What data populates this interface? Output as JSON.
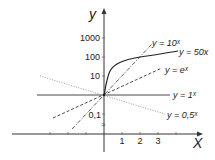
{
  "diagram": {
    "axes": {
      "x_label": "X",
      "y_label": "y",
      "x_ticks": [
        "1",
        "2",
        "3"
      ],
      "y_ticks": [
        "1000",
        "100",
        "10",
        "0,1"
      ]
    },
    "curves": [
      {
        "name": "y = 10ˣ",
        "style": "dash-dot",
        "color": "#333333"
      },
      {
        "name": "y = 50x",
        "style": "solid",
        "color": "#222222"
      },
      {
        "name": "y = eˣ",
        "style": "dashed",
        "color": "#333333"
      },
      {
        "name": "y = 1ˣ",
        "style": "solid",
        "color": "#333333"
      },
      {
        "name": "y = 0,5ˣ",
        "style": "dotted",
        "color": "#888888"
      }
    ]
  }
}
